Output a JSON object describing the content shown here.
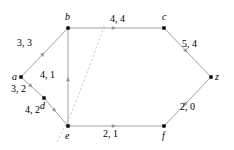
{
  "figure": {
    "width": 234,
    "height": 150,
    "background": "#ffffff",
    "edge_color": "#999999",
    "node_color": "#000000",
    "cut_color": "#c8c8c8",
    "text_color": "#000000"
  },
  "chart_data": {
    "type": "diagram",
    "subtype": "directed-flow-network",
    "title": "",
    "label_format": "capacity, flow",
    "nodes": [
      {
        "id": "a",
        "label": "a",
        "x": 21,
        "y": 77,
        "label_dx": -9,
        "label_dy": -5
      },
      {
        "id": "b",
        "label": "b",
        "x": 68,
        "y": 28,
        "label_dx": -3,
        "label_dy": -16
      },
      {
        "id": "c",
        "label": "c",
        "x": 164,
        "y": 28,
        "label_dx": -2,
        "label_dy": -16
      },
      {
        "id": "d",
        "label": "d",
        "x": 44,
        "y": 98,
        "label_dx": -4,
        "label_dy": 3
      },
      {
        "id": "e",
        "label": "e",
        "x": 68,
        "y": 126,
        "label_dx": -3,
        "label_dy": 5
      },
      {
        "id": "f",
        "label": "f",
        "x": 164,
        "y": 126,
        "label_dx": -2,
        "label_dy": 5
      },
      {
        "id": "z",
        "label": "z",
        "x": 211,
        "y": 77,
        "label_dx": 4,
        "label_dy": -5
      }
    ],
    "edges": [
      {
        "from": "a",
        "to": "b",
        "capacity": 3,
        "flow": 3,
        "label": "3, 3",
        "label_x": 17,
        "label_y": 38
      },
      {
        "from": "b",
        "to": "c",
        "capacity": 4,
        "flow": 4,
        "label": "4, 4",
        "label_x": 110,
        "label_y": 14
      },
      {
        "from": "c",
        "to": "z",
        "capacity": 5,
        "flow": 4,
        "label": "5, 4",
        "label_x": 182,
        "label_y": 39
      },
      {
        "from": "e",
        "to": "b",
        "capacity": 4,
        "flow": 1,
        "label": "4, 1",
        "label_x": 40,
        "label_y": 70
      },
      {
        "from": "a",
        "to": "d",
        "capacity": 3,
        "flow": 2,
        "label": "3, 2",
        "label_x": 11,
        "label_y": 84
      },
      {
        "from": "d",
        "to": "e",
        "capacity": 4,
        "flow": 2,
        "label": "4, 2",
        "label_x": 25,
        "label_y": 105
      },
      {
        "from": "e",
        "to": "f",
        "capacity": 2,
        "flow": 1,
        "label": "2, 1",
        "label_x": 103,
        "label_y": 129
      },
      {
        "from": "f",
        "to": "z",
        "capacity": 2,
        "flow": 0,
        "label": "2, 0",
        "label_x": 180,
        "label_y": 102
      }
    ],
    "cut_curve": {
      "name": "dashed-cut",
      "style": "dashed",
      "description": "dashed curve separating the source side from the sink side",
      "path": "M 57,142 L 64,128 C 74,110 88,70 105,24"
    },
    "axis_labels": {
      "xlabel": "",
      "ylabel": ""
    },
    "legend": []
  }
}
